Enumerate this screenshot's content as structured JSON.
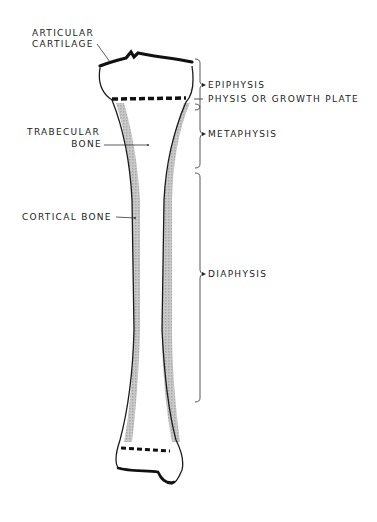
{
  "diagram": {
    "left_labels": {
      "articular_cartilage_line1": "ARTICULAR",
      "articular_cartilage_line2": "CARTILAGE",
      "trabecular_bone_line1": "TRABECULAR",
      "trabecular_bone_line2": "BONE",
      "cortical_bone": "CORTICAL BONE"
    },
    "right_labels": {
      "epiphysis": "EPIPHYSIS",
      "physis": "PHYSIS OR GROWTH PLATE",
      "metaphysis": "METAPHYSIS",
      "diaphysis": "DIAPHYSIS"
    },
    "colors": {
      "ink": "#1a1a1a",
      "cortical_shade": "#b8b8b8",
      "background": "#ffffff"
    }
  }
}
